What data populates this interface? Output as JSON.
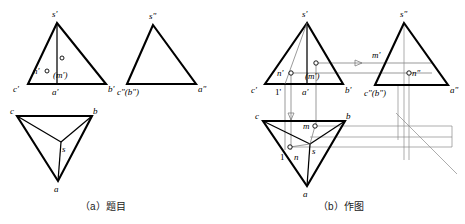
{
  "figure": {
    "captions": [
      {
        "id": "caption-a",
        "text": "（a）题目"
      },
      {
        "id": "caption-b",
        "text": "（b）作图"
      }
    ],
    "colors": {
      "outline": "#000000",
      "projection_line": "#6f6f6f",
      "background": "#ffffff"
    },
    "panel_a": {
      "name": "题目",
      "front_view": {
        "vertex_labels": [
          "s'",
          "c'",
          "b'",
          "a'"
        ],
        "point_labels": [
          "n'",
          "(m')"
        ]
      },
      "side_view": {
        "vertex_labels": [
          "s\"",
          "c\"(b\")",
          "a\""
        ]
      },
      "top_view": {
        "vertex_labels": [
          "c",
          "b",
          "a",
          "s"
        ]
      }
    },
    "panel_b": {
      "name": "作图",
      "front_view": {
        "vertex_labels": [
          "s'",
          "c'",
          "b'",
          "a'"
        ],
        "point_labels": [
          "n'",
          "(m')",
          "1'"
        ]
      },
      "side_view": {
        "vertex_labels": [
          "s\"",
          "c\"(b\")",
          "a\""
        ],
        "point_labels": [
          "m'",
          "n\""
        ]
      },
      "top_view": {
        "vertex_labels": [
          "c",
          "b",
          "a",
          "s"
        ],
        "point_labels": [
          "m",
          "n",
          "1"
        ]
      }
    }
  },
  "geometry": {
    "a_front": {
      "s": [
        57,
        23
      ],
      "c": [
        28,
        84
      ],
      "b": [
        106,
        84
      ],
      "a": [
        57,
        84
      ]
    },
    "a_side": {
      "s": [
        153,
        25
      ],
      "cb": [
        127,
        84
      ],
      "a": [
        196,
        84
      ]
    },
    "a_top": {
      "c": [
        17,
        116
      ],
      "b": [
        92,
        116
      ],
      "a": [
        58,
        181
      ],
      "s": [
        61,
        142
      ]
    },
    "b_front": {
      "s": [
        307,
        23
      ],
      "c": [
        265,
        84
      ],
      "b": [
        343,
        84
      ],
      "a": [
        307,
        84
      ]
    },
    "b_side": {
      "s": [
        404,
        23
      ],
      "cb": [
        375,
        85
      ],
      "a": [
        448,
        85
      ]
    },
    "b_top": {
      "c": [
        263,
        121
      ],
      "b": [
        345,
        121
      ],
      "a": [
        307,
        186
      ],
      "s": [
        310,
        144
      ]
    },
    "b_points": {
      "m_front": [
        316,
        63
      ],
      "n_front": [
        291,
        73
      ],
      "m_top": [
        315,
        126
      ],
      "n_top": [
        290,
        147
      ],
      "n_side": [
        409,
        73
      ],
      "one_top": [
        292,
        146
      ]
    }
  }
}
